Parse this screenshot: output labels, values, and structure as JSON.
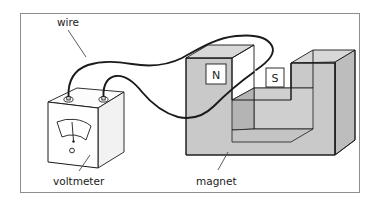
{
  "figure": {
    "kind": "physics-diagram",
    "background_color": "#ffffff",
    "frame": {
      "border_color": "#8e8e8e",
      "fill": "#ffffff"
    }
  },
  "labels": {
    "wire": "wire",
    "voltmeter": "voltmeter",
    "magnet": "magnet"
  },
  "poles": {
    "north": "N",
    "south": "S"
  },
  "colors": {
    "outline": "#1a1a1a",
    "magnet_front": "#c9c9c9",
    "magnet_top": "#d8d8d8",
    "magnet_side": "#bdbdbd",
    "magnet_inner": "#b4b4b4",
    "pole_label_face": "#ffffff",
    "voltmeter_front": "#ffffff",
    "voltmeter_top": "#fafafa",
    "voltmeter_side": "#f0f0f0",
    "wire": "#1a1a1a",
    "leader_line": "#4a4a4a"
  },
  "parts": {
    "voltmeter": {
      "name": "voltmeter",
      "dial": "fan-scale-with-needle",
      "terminals": 2,
      "knob": "zero-adjust-screw"
    },
    "magnet": {
      "name": "magnet",
      "shape": "U-shaped horseshoe block",
      "poles": [
        "N",
        "S"
      ]
    },
    "wire": {
      "name": "wire",
      "description": "two leads from voltmeter terminals forming a loop around the north pole"
    }
  }
}
